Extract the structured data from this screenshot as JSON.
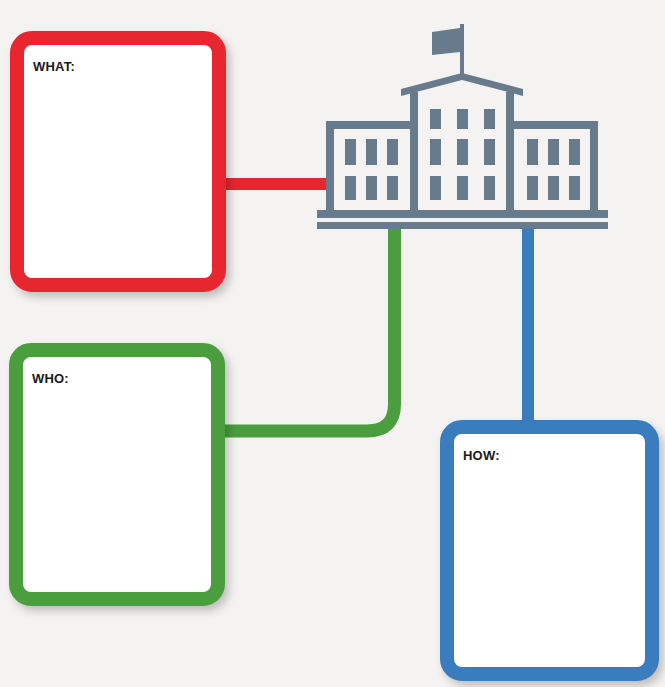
{
  "diagram": {
    "type": "graphic-organizer",
    "center_icon": "school-building-icon",
    "colors": {
      "background": "#f4f3f1",
      "building": "#687b8c",
      "what": "#e8262f",
      "who": "#4b9e3e",
      "how": "#3a7dbf"
    },
    "boxes": [
      {
        "id": "what",
        "label": "WHAT:",
        "color": "#e8262f"
      },
      {
        "id": "who",
        "label": "WHO:",
        "color": "#4b9e3e"
      },
      {
        "id": "how",
        "label": "HOW:",
        "color": "#3a7dbf"
      }
    ]
  }
}
